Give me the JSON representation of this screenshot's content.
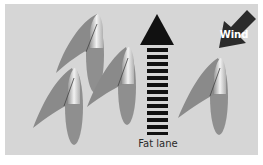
{
  "diagram": {
    "labels": {
      "fat_lane": "Fat lane",
      "wind": "Wind"
    },
    "colors": {
      "background": "#d6d6d6",
      "border": "#ffffff",
      "sail": "#8a8a8a",
      "hull": "#8f8f8f",
      "arrow": "#111111",
      "wind_arrow": "#2b2b2b"
    },
    "boats": [
      {
        "id": 1
      },
      {
        "id": 2
      },
      {
        "id": 3
      },
      {
        "id": 4
      }
    ]
  }
}
